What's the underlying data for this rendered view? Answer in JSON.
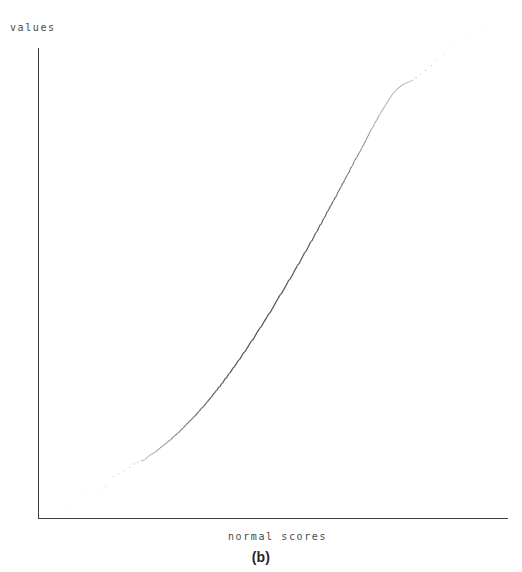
{
  "figure": {
    "caption": "(b)",
    "background_color": "#ffffff",
    "axis_color": "#3c3c3c",
    "point_color": "#555555",
    "label_color": "#4a4a4a"
  },
  "chart_data": {
    "type": "scatter",
    "title": "",
    "subtitle": "",
    "xlabel": "normal scores",
    "ylabel": "values",
    "caption": "(b)",
    "grid": false,
    "legend": null,
    "axis_ticks": false,
    "tick_labels": {
      "x": [],
      "y": []
    },
    "xlim": [
      -3.0,
      3.0
    ],
    "ylim": [
      0.0,
      1.0
    ],
    "series": [
      {
        "name": "sample quantiles vs normal scores",
        "marker": "dot",
        "marker_size": 1.2,
        "x": [
          -2.86,
          -2.62,
          -2.46,
          -2.34,
          -2.24,
          -2.16,
          -2.08,
          -2.01,
          -1.95,
          -1.9,
          -1.85,
          -1.8,
          -1.76,
          -1.72,
          -1.68,
          -1.64,
          -1.61,
          -1.58,
          -1.55,
          -1.52,
          -1.49,
          -1.46,
          -1.43,
          -1.41,
          -1.38,
          -1.36,
          -1.33,
          -1.31,
          -1.29,
          -1.27,
          -1.25,
          -1.23,
          -1.21,
          -1.19,
          -1.17,
          -1.15,
          -1.13,
          -1.11,
          -1.09,
          -1.08,
          -1.06,
          -1.04,
          -1.03,
          -1.01,
          -0.99,
          -0.98,
          -0.96,
          -0.95,
          -0.93,
          -0.92,
          -0.9,
          -0.89,
          -0.87,
          -0.86,
          -0.85,
          -0.83,
          -0.82,
          -0.8,
          -0.79,
          -0.78,
          -0.76,
          -0.75,
          -0.74,
          -0.72,
          -0.71,
          -0.7,
          -0.69,
          -0.67,
          -0.66,
          -0.65,
          -0.64,
          -0.62,
          -0.61,
          -0.6,
          -0.59,
          -0.58,
          -0.56,
          -0.55,
          -0.54,
          -0.53,
          -0.52,
          -0.51,
          -0.49,
          -0.48,
          -0.47,
          -0.46,
          -0.45,
          -0.44,
          -0.43,
          -0.41,
          -0.4,
          -0.39,
          -0.38,
          -0.37,
          -0.36,
          -0.35,
          -0.34,
          -0.33,
          -0.31,
          -0.3,
          -0.29,
          -0.28,
          -0.27,
          -0.26,
          -0.25,
          -0.24,
          -0.23,
          -0.22,
          -0.21,
          -0.19,
          -0.18,
          -0.17,
          -0.16,
          -0.15,
          -0.14,
          -0.13,
          -0.12,
          -0.11,
          -0.1,
          -0.09,
          -0.07,
          -0.06,
          -0.05,
          -0.04,
          -0.03,
          -0.02,
          -0.01,
          0.0,
          0.01,
          0.02,
          0.03,
          0.04,
          0.05,
          0.06,
          0.07,
          0.09,
          0.1,
          0.11,
          0.12,
          0.13,
          0.14,
          0.15,
          0.16,
          0.17,
          0.18,
          0.19,
          0.21,
          0.22,
          0.23,
          0.24,
          0.25,
          0.26,
          0.27,
          0.28,
          0.29,
          0.3,
          0.31,
          0.33,
          0.34,
          0.35,
          0.36,
          0.37,
          0.38,
          0.39,
          0.4,
          0.41,
          0.43,
          0.44,
          0.45,
          0.46,
          0.47,
          0.48,
          0.49,
          0.51,
          0.52,
          0.53,
          0.54,
          0.55,
          0.56,
          0.58,
          0.59,
          0.6,
          0.61,
          0.62,
          0.64,
          0.65,
          0.66,
          0.67,
          0.69,
          0.7,
          0.71,
          0.72,
          0.74,
          0.75,
          0.76,
          0.78,
          0.79,
          0.8,
          0.82,
          0.83,
          0.85,
          0.86,
          0.87,
          0.89,
          0.9,
          0.92,
          0.93,
          0.95,
          0.96,
          0.98,
          0.99,
          1.01,
          1.03,
          1.04,
          1.06,
          1.08,
          1.09,
          1.11,
          1.13,
          1.15,
          1.17,
          1.19,
          1.21,
          1.23,
          1.25,
          1.27,
          1.29,
          1.31,
          1.33,
          1.36,
          1.38,
          1.41,
          1.43,
          1.46,
          1.49,
          1.52,
          1.55,
          1.58,
          1.61,
          1.64,
          1.68,
          1.72,
          1.76,
          1.8,
          1.85,
          1.9,
          1.95,
          2.01,
          2.08,
          2.16,
          2.24,
          2.34,
          2.46,
          2.62,
          2.86
        ],
        "y": [
          0.018,
          0.04,
          0.052,
          0.06,
          0.083,
          0.089,
          0.096,
          0.104,
          0.112,
          0.116,
          0.119,
          0.122,
          0.128,
          0.133,
          0.137,
          0.141,
          0.146,
          0.15,
          0.154,
          0.158,
          0.162,
          0.166,
          0.17,
          0.174,
          0.178,
          0.181,
          0.185,
          0.189,
          0.192,
          0.196,
          0.199,
          0.203,
          0.206,
          0.21,
          0.213,
          0.216,
          0.22,
          0.223,
          0.226,
          0.229,
          0.232,
          0.236,
          0.239,
          0.242,
          0.245,
          0.248,
          0.251,
          0.254,
          0.257,
          0.26,
          0.263,
          0.266,
          0.269,
          0.272,
          0.275,
          0.278,
          0.281,
          0.284,
          0.287,
          0.29,
          0.292,
          0.295,
          0.298,
          0.301,
          0.304,
          0.307,
          0.31,
          0.312,
          0.315,
          0.318,
          0.321,
          0.324,
          0.327,
          0.329,
          0.332,
          0.335,
          0.338,
          0.341,
          0.343,
          0.346,
          0.349,
          0.352,
          0.355,
          0.357,
          0.36,
          0.363,
          0.366,
          0.369,
          0.371,
          0.374,
          0.377,
          0.38,
          0.383,
          0.385,
          0.388,
          0.391,
          0.394,
          0.397,
          0.4,
          0.402,
          0.405,
          0.408,
          0.411,
          0.414,
          0.417,
          0.42,
          0.422,
          0.425,
          0.428,
          0.431,
          0.434,
          0.437,
          0.44,
          0.443,
          0.446,
          0.448,
          0.451,
          0.454,
          0.457,
          0.46,
          0.463,
          0.466,
          0.469,
          0.472,
          0.475,
          0.478,
          0.481,
          0.484,
          0.487,
          0.49,
          0.493,
          0.496,
          0.499,
          0.502,
          0.505,
          0.508,
          0.511,
          0.514,
          0.517,
          0.52,
          0.523,
          0.526,
          0.529,
          0.532,
          0.536,
          0.539,
          0.542,
          0.545,
          0.548,
          0.551,
          0.554,
          0.558,
          0.561,
          0.564,
          0.567,
          0.57,
          0.574,
          0.577,
          0.58,
          0.583,
          0.587,
          0.59,
          0.593,
          0.597,
          0.6,
          0.603,
          0.607,
          0.61,
          0.613,
          0.617,
          0.62,
          0.624,
          0.627,
          0.631,
          0.634,
          0.638,
          0.641,
          0.645,
          0.648,
          0.652,
          0.656,
          0.659,
          0.663,
          0.667,
          0.67,
          0.674,
          0.678,
          0.682,
          0.686,
          0.69,
          0.694,
          0.698,
          0.702,
          0.706,
          0.71,
          0.714,
          0.718,
          0.722,
          0.727,
          0.731,
          0.735,
          0.74,
          0.744,
          0.749,
          0.753,
          0.758,
          0.763,
          0.767,
          0.772,
          0.777,
          0.782,
          0.787,
          0.792,
          0.798,
          0.803,
          0.808,
          0.814,
          0.82,
          0.825,
          0.831,
          0.837,
          0.843,
          0.85,
          0.856,
          0.862,
          0.869,
          0.876,
          0.883,
          0.89,
          0.897,
          0.905,
          0.912,
          0.92,
          0.928,
          0.936,
          0.944,
          0.952,
          0.96,
          0.968,
          0.975,
          0.982,
          0.988,
          0.993,
          0.997,
          1.0,
          1.004,
          1.01,
          1.018,
          1.027,
          1.038,
          1.05,
          1.064,
          1.08,
          1.1,
          1.128
        ]
      }
    ]
  },
  "axes": {
    "y_axis_label": "values",
    "x_axis_label": "normal scores",
    "origin_px": [
      38,
      518
    ],
    "y_axis_top_px": 48,
    "x_axis_right_px": 508
  }
}
